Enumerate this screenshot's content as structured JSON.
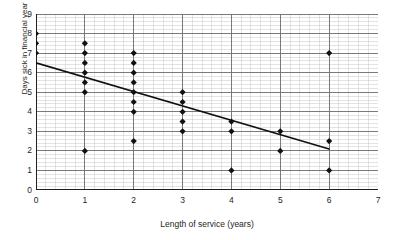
{
  "top_sliver_text": "",
  "axes": {
    "x_title": "Length of service (years)",
    "y_title": "Days sick in financial year",
    "x_ticks": [
      "0",
      "1",
      "2",
      "3",
      "4",
      "5",
      "6",
      "7"
    ],
    "y_ticks": [
      "0",
      "1",
      "2",
      "3",
      "4",
      "5",
      "6",
      "7",
      "8",
      "9"
    ]
  },
  "style": {
    "major_grid_color": "#6e6e6e",
    "minor_grid_color": "#c8c8c8",
    "axis_color": "#231f20",
    "marker_color": "#111111",
    "trend_line_color": "#111111"
  },
  "chart_data": {
    "type": "scatter",
    "title": "",
    "xlabel": "Length of service (years)",
    "ylabel": "Days sick in financial year",
    "xlim": [
      0,
      7
    ],
    "ylim": [
      0,
      9
    ],
    "x_major_step": 1,
    "y_major_step": 1,
    "x_minor_divisions": 5,
    "y_minor_divisions": 5,
    "grid": true,
    "legend": false,
    "marker": "diamond",
    "points": [
      {
        "x": 0,
        "y": 8
      },
      {
        "x": 0,
        "y": 7.5
      },
      {
        "x": 0,
        "y": 7
      },
      {
        "x": 1,
        "y": 7.5
      },
      {
        "x": 1,
        "y": 7
      },
      {
        "x": 1,
        "y": 6.5
      },
      {
        "x": 1,
        "y": 6
      },
      {
        "x": 1,
        "y": 5.5
      },
      {
        "x": 1,
        "y": 5
      },
      {
        "x": 1,
        "y": 2
      },
      {
        "x": 2,
        "y": 7
      },
      {
        "x": 2,
        "y": 6.5
      },
      {
        "x": 2,
        "y": 6
      },
      {
        "x": 2,
        "y": 5.5
      },
      {
        "x": 2,
        "y": 5
      },
      {
        "x": 2,
        "y": 4.5
      },
      {
        "x": 2,
        "y": 4
      },
      {
        "x": 2,
        "y": 2.5
      },
      {
        "x": 3,
        "y": 5
      },
      {
        "x": 3,
        "y": 4.5
      },
      {
        "x": 3,
        "y": 4
      },
      {
        "x": 3,
        "y": 3.5
      },
      {
        "x": 3,
        "y": 3
      },
      {
        "x": 4,
        "y": 3.5
      },
      {
        "x": 4,
        "y": 3
      },
      {
        "x": 4,
        "y": 1
      },
      {
        "x": 5,
        "y": 3
      },
      {
        "x": 5,
        "y": 2
      },
      {
        "x": 6,
        "y": 7
      },
      {
        "x": 6,
        "y": 2.5
      },
      {
        "x": 6,
        "y": 1
      }
    ],
    "trend_line": {
      "label": "line of best fit",
      "x1": 0,
      "y1": 6.5,
      "x2": 6,
      "y2": 2.1
    }
  }
}
